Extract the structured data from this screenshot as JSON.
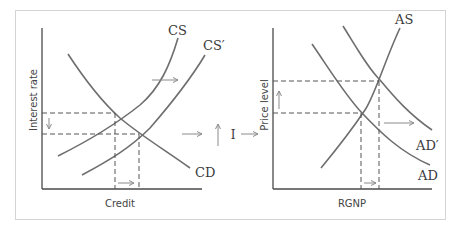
{
  "diagram": {
    "type": "economics-two-panel",
    "left_panel": {
      "x_label": "Credit",
      "y_label": "Interest rate",
      "curves": [
        {
          "name": "CS",
          "label": "CS",
          "kind": "supply"
        },
        {
          "name": "CS_prime",
          "label": "CS′",
          "kind": "supply-shifted"
        },
        {
          "name": "CD",
          "label": "CD",
          "kind": "demand"
        }
      ]
    },
    "connector": {
      "label": "I",
      "arrows": [
        "right",
        "up",
        "right"
      ]
    },
    "right_panel": {
      "x_label": "RGNP",
      "y_label": "Price level",
      "curves": [
        {
          "name": "AS",
          "label": "AS",
          "kind": "supply"
        },
        {
          "name": "AD_prime",
          "label": "AD′",
          "kind": "demand-shifted"
        },
        {
          "name": "AD",
          "label": "AD",
          "kind": "demand"
        }
      ]
    },
    "colors": {
      "curve": "#6e6e6e",
      "axis": "#4a4a4a",
      "arrow": "#8a8a8a",
      "frame": "#d4d4d4"
    }
  }
}
